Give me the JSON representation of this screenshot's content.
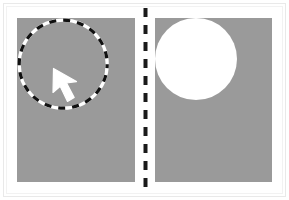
{
  "figure": {
    "width": 289,
    "height": 200,
    "background_color": "#ffffff",
    "frame_color": "#e9e9e9",
    "caption": ""
  },
  "divider": {
    "name": "dashed-vertical-divider",
    "orientation": "vertical",
    "color": "#1a1a1a",
    "stroke_width": 4,
    "dash_length": 9,
    "gap_length": 8,
    "x": 2.5,
    "y_start": 0,
    "y_end": 186
  },
  "panels": [
    {
      "id": "left",
      "name": "selection-panel",
      "label": "",
      "background_color": "#9a9a9a",
      "x": 17,
      "y": 18,
      "width": 118,
      "height": 164,
      "shape": {
        "name": "marching-ants-circle",
        "type": "dashed-outline-circle",
        "center_x": 45,
        "center_y": 45,
        "radius": 44,
        "dash_colors": [
          "#111111",
          "#ffffff"
        ],
        "dash_length": 7,
        "stroke_width": 3.2,
        "fill": "none"
      },
      "cursor": {
        "name": "mouse-pointer-arrow",
        "color": "#ffffff",
        "direction": "up-left",
        "tip_x": 2,
        "tip_y": 2
      }
    },
    {
      "id": "right",
      "name": "result-panel",
      "label": "",
      "background_color": "#9a9a9a",
      "x": 155,
      "y": 18,
      "width": 117,
      "height": 164,
      "shape": {
        "name": "filled-white-disc",
        "type": "filled-circle",
        "center_x": 41,
        "center_y": 41,
        "radius": 41,
        "fill_color": "#ffffff",
        "stroke": "none"
      },
      "cursor": null
    }
  ]
}
